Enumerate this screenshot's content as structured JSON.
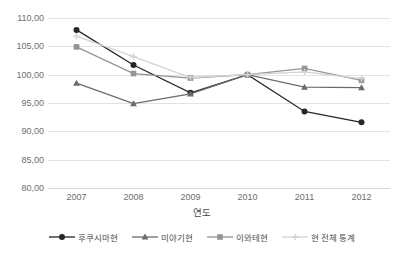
{
  "chart_data": {
    "type": "line",
    "title": "",
    "xlabel": "연도",
    "ylabel": "",
    "categories": [
      "2007",
      "2008",
      "2009",
      "2010",
      "2011",
      "2012"
    ],
    "ylim": [
      80.0,
      110.0
    ],
    "ytick_labels": [
      "110,00",
      "105,00",
      "100,00",
      "95,00",
      "90,00",
      "85,00",
      "80,00"
    ],
    "ytick_values": [
      110,
      105,
      100,
      95,
      90,
      85,
      80
    ],
    "grid": true,
    "legend_position": "bottom",
    "series": [
      {
        "name": "후쿠시마현",
        "marker": "circle",
        "color": "#262626",
        "values": [
          107.9,
          101.7,
          96.8,
          100.0,
          93.5,
          91.6
        ]
      },
      {
        "name": "미야기현",
        "marker": "triangle",
        "color": "#6b6b6b",
        "values": [
          98.5,
          94.9,
          96.6,
          100.0,
          97.8,
          97.7
        ]
      },
      {
        "name": "이와테현",
        "marker": "square",
        "color": "#949494",
        "values": [
          104.9,
          100.2,
          99.4,
          100.0,
          101.1,
          99.0
        ]
      },
      {
        "name": "현 전체 통계",
        "marker": "plus",
        "color": "#d2d2d2",
        "values": [
          106.8,
          103.2,
          99.5,
          100.0,
          100.5,
          99.3
        ]
      }
    ]
  },
  "axis": {
    "x_title": "연도"
  }
}
